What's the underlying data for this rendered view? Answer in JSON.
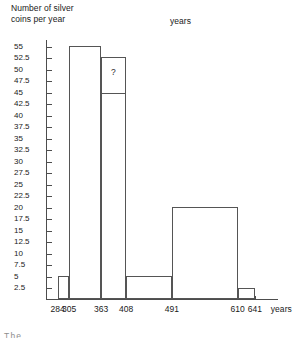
{
  "chart_data": {
    "type": "bar",
    "title": "",
    "ylabel": "Number of silver coins per year",
    "ylabel_lines": [
      "Number of silver",
      "coins per year"
    ],
    "xlabel": "years",
    "top_xlabel": "years",
    "end_xlabel": "years",
    "bin_edges": [
      284,
      305,
      363,
      408,
      491,
      610,
      641
    ],
    "bin_edge_labels": [
      "284",
      "305",
      "363",
      "408",
      "491",
      "610",
      "641"
    ],
    "categories": [
      "284-305",
      "305-363",
      "363-408",
      "408-491",
      "491-610",
      "610-641"
    ],
    "values": [
      5,
      55,
      52.5,
      5,
      20,
      2.5
    ],
    "ylim": [
      0,
      56.5
    ],
    "xlim": [
      263,
      683
    ],
    "ytick_labels": [
      "2.5",
      "5",
      "7.5",
      "10",
      "12.5",
      "15",
      "17.5",
      "20",
      "22.5",
      "25",
      "27.5",
      "30",
      "32.5",
      "35",
      "37.5",
      "40",
      "42.5",
      "45",
      "47.5",
      "50",
      "52.5",
      "55"
    ],
    "ytick_values": [
      2.5,
      5,
      7.5,
      10,
      12.5,
      15,
      17.5,
      20,
      22.5,
      25,
      27.5,
      30,
      32.5,
      35,
      37.5,
      40,
      42.5,
      45,
      47.5,
      50,
      52.5,
      55
    ],
    "grid": false,
    "legend": null,
    "annotations": [
      {
        "text": "?",
        "bin": "363-408",
        "x": 385,
        "y": 50.5
      },
      {
        "text": "",
        "bin": "363-408",
        "type": "line-marker",
        "x": 385,
        "y": 45
      }
    ],
    "colors": {
      "bar_stroke": "#555555",
      "bar_fill": "transparent",
      "axis": "#4d4d4d",
      "text": "#1a1a1a",
      "background": "#ffffff"
    }
  },
  "footer": {
    "cut_text": "The"
  }
}
